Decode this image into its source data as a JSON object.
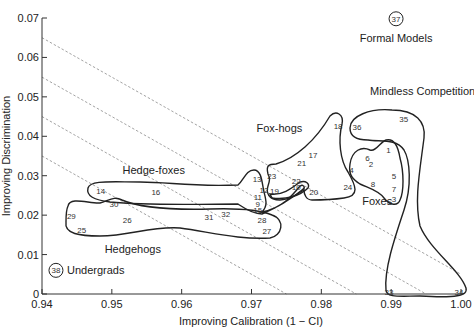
{
  "chart_data": {
    "type": "scatter",
    "title": "",
    "xlabel": "Improving Calibration (1 − CI)",
    "ylabel": "Improving Discrimination",
    "xlim": [
      0.94,
      1.0
    ],
    "ylim": [
      0,
      0.07
    ],
    "x_ticks": [
      "0.94",
      "0.95",
      "0.96",
      "0.97",
      "0.98",
      "0.99",
      "1.00"
    ],
    "y_ticks": [
      "0",
      "0.01",
      "0.02",
      "0.03",
      "0.04",
      "0.05",
      "0.06",
      "0.07"
    ],
    "grid": false,
    "iso_lines": {
      "style": "dashed",
      "description": "diagonal lines of constant calibration + discrimination (x + y = const)",
      "constants": [
        1.005,
        0.995,
        0.985,
        0.975
      ]
    },
    "points": [
      {
        "id": "1",
        "x": 0.9896,
        "y": 0.0365
      },
      {
        "id": "2",
        "x": 0.9871,
        "y": 0.033
      },
      {
        "id": "3",
        "x": 0.9904,
        "y": 0.024
      },
      {
        "id": "4",
        "x": 0.9843,
        "y": 0.0315
      },
      {
        "id": "5",
        "x": 0.9904,
        "y": 0.03
      },
      {
        "id": "6",
        "x": 0.9866,
        "y": 0.0345
      },
      {
        "id": "7",
        "x": 0.9904,
        "y": 0.0267
      },
      {
        "id": "8",
        "x": 0.9874,
        "y": 0.028
      },
      {
        "id": "9",
        "x": 0.9709,
        "y": 0.0228
      },
      {
        "id": "10",
        "x": 0.9764,
        "y": 0.0272
      },
      {
        "id": "11",
        "x": 0.9709,
        "y": 0.0246
      },
      {
        "id": "12",
        "x": 0.9718,
        "y": 0.0264
      },
      {
        "id": "13",
        "x": 0.9708,
        "y": 0.0292
      },
      {
        "id": "14",
        "x": 0.9484,
        "y": 0.0261
      },
      {
        "id": "15",
        "x": 0.9709,
        "y": 0.0213
      },
      {
        "id": "16",
        "x": 0.9563,
        "y": 0.0259
      },
      {
        "id": "17",
        "x": 0.9788,
        "y": 0.0353
      },
      {
        "id": "18",
        "x": 0.9824,
        "y": 0.0426
      },
      {
        "id": "19",
        "x": 0.9733,
        "y": 0.0261
      },
      {
        "id": "20",
        "x": 0.9789,
        "y": 0.0259
      },
      {
        "id": "21",
        "x": 0.9772,
        "y": 0.0333
      },
      {
        "id": "22",
        "x": 0.9764,
        "y": 0.0287
      },
      {
        "id": "23",
        "x": 0.9729,
        "y": 0.03
      },
      {
        "id": "24",
        "x": 0.9838,
        "y": 0.0272
      },
      {
        "id": "25",
        "x": 0.9457,
        "y": 0.0162
      },
      {
        "id": "26",
        "x": 0.9522,
        "y": 0.0188
      },
      {
        "id": "27",
        "x": 0.9722,
        "y": 0.016
      },
      {
        "id": "28",
        "x": 0.9715,
        "y": 0.0188
      },
      {
        "id": "29",
        "x": 0.9442,
        "y": 0.0198
      },
      {
        "id": "30",
        "x": 0.9503,
        "y": 0.0228
      },
      {
        "id": "31",
        "x": 0.9639,
        "y": 0.0195
      },
      {
        "id": "32",
        "x": 0.9663,
        "y": 0.0203
      },
      {
        "id": "33",
        "x": 0.9897,
        "y": 0.0005
      },
      {
        "id": "34",
        "x": 0.9997,
        "y": 0.0005
      },
      {
        "id": "35",
        "x": 0.9918,
        "y": 0.0444
      },
      {
        "id": "36",
        "x": 0.9851,
        "y": 0.0424
      },
      {
        "id": "37",
        "x": 0.9907,
        "y": 0.0698,
        "circled": true,
        "label": "Formal Models"
      },
      {
        "id": "38",
        "x": 0.942,
        "y": 0.006,
        "circled": true,
        "label": "Undergrads"
      }
    ],
    "groups": [
      {
        "name": "Hedgehogs",
        "members": [
          "25",
          "26",
          "29",
          "30",
          "31",
          "32",
          "27",
          "28"
        ],
        "label_pos": [
          0.953,
          0.0105
        ]
      },
      {
        "name": "Hedge-foxes",
        "members": [
          "14",
          "16",
          "13",
          "12",
          "11",
          "9",
          "15"
        ],
        "label_pos": [
          0.956,
          0.0305
        ]
      },
      {
        "name": "Fox-hogs",
        "members": [
          "17",
          "18",
          "21",
          "22",
          "23",
          "10",
          "19",
          "20",
          "24"
        ],
        "label_pos": [
          0.974,
          0.041
        ]
      },
      {
        "name": "Foxes",
        "members": [
          "1",
          "2",
          "3",
          "4",
          "5",
          "6",
          "7",
          "8"
        ],
        "label_pos": [
          0.988,
          0.0225
        ]
      },
      {
        "name": "Mindless Competition",
        "members": [
          "33",
          "34",
          "35",
          "36"
        ],
        "label_pos": [
          0.9945,
          0.0505
        ]
      }
    ]
  }
}
